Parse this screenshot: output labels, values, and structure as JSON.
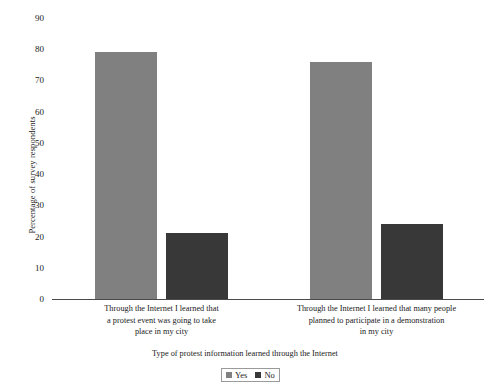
{
  "chart_data": {
    "type": "bar",
    "title": "",
    "subtitle": "",
    "xlabel": "Type of protest information learned through the Internet",
    "ylabel": "Percentage of survey respondents",
    "categories": [
      "Through the Internet I learned that a protest event was going to take place in my city",
      "Through the Internet I learned that many people planned to participate in a demonstration in my city"
    ],
    "category_lines": [
      [
        "Through the Internet I learned that",
        "a protest event was going to take",
        "place in my city"
      ],
      [
        "Through the Internet I learned that many people",
        "planned to participate in a demonstration",
        "in my city"
      ]
    ],
    "series": [
      {
        "name": "Yes",
        "color": "#808080",
        "values": [
          79,
          76
        ]
      },
      {
        "name": "No",
        "color": "#383838",
        "values": [
          21,
          24
        ]
      }
    ],
    "ylim": [
      0,
      90
    ],
    "yticks": [
      0,
      10,
      20,
      30,
      40,
      50,
      60,
      70,
      80,
      90
    ],
    "ytick_labels": [
      "0",
      "10",
      "20",
      "30",
      "40",
      "50",
      "60",
      "70",
      "80",
      "90"
    ],
    "grid": false,
    "legend_position": "bottom-center",
    "legend_entries": [
      "Yes",
      "No"
    ]
  }
}
